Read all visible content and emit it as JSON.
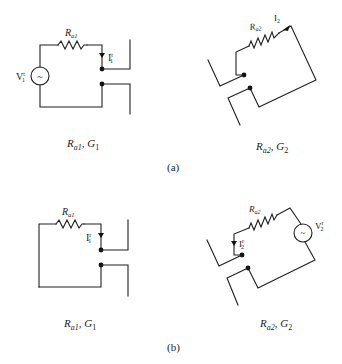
{
  "figure": {
    "panels": [
      {
        "id": "a",
        "label": "(a)",
        "circuits": [
          {
            "name": "antenna-1",
            "caption": {
              "R": "R",
              "R_sub": "a1",
              "sep": ", ",
              "G": "G",
              "G_sub": "1"
            },
            "resistor_label": {
              "main": "R",
              "sub": "a1"
            },
            "current_label": {
              "main": "I",
              "sup": "t",
              "sub": "1"
            },
            "source_label": {
              "main": "V",
              "sup": "t",
              "sub": "1"
            },
            "has_source": true,
            "source_symbol": "~"
          },
          {
            "name": "antenna-2",
            "caption": {
              "R": "R",
              "R_sub": "a2",
              "sep": ", ",
              "G": "G",
              "G_sub": "2"
            },
            "resistor_label": {
              "main": "R",
              "sub": "a2"
            },
            "current_label": {
              "main": "I",
              "sup": "",
              "sub": "2"
            },
            "has_source": false
          }
        ]
      },
      {
        "id": "b",
        "label": "(b)",
        "circuits": [
          {
            "name": "antenna-1",
            "caption": {
              "R": "R",
              "R_sub": "a1",
              "sep": ", ",
              "G": "G",
              "G_sub": "1"
            },
            "resistor_label": {
              "main": "R",
              "sub": "a1"
            },
            "current_label": {
              "main": "I",
              "sup": "r",
              "sub": "1"
            },
            "has_source": false
          },
          {
            "name": "antenna-2",
            "caption": {
              "R": "R",
              "R_sub": "a2",
              "sep": ", ",
              "G": "G",
              "G_sub": "2"
            },
            "resistor_label": {
              "main": "R",
              "sub": "a2"
            },
            "current_label": {
              "main": "I",
              "sup": "r",
              "sub": "2"
            },
            "source_label": {
              "main": "V",
              "sup": "r",
              "sub": "2"
            },
            "has_source": true,
            "source_symbol": "~"
          }
        ]
      }
    ]
  },
  "colors": {
    "ink": "#1f1f1f",
    "background": "#ffffff"
  }
}
